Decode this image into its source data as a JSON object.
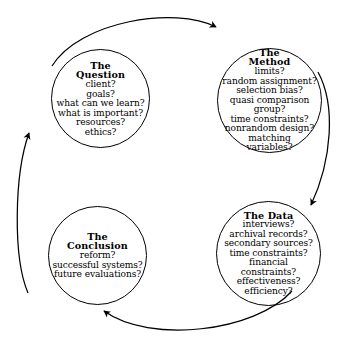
{
  "diagram": {
    "type": "cycle-diagram",
    "direction": "clockwise",
    "background_color": "#ffffff",
    "line_color": "#000000"
  },
  "nodes": [
    {
      "id": "question",
      "title_lines": [
        "The",
        "Question"
      ],
      "title_line_1": "The",
      "title_line_2": "Question",
      "items": [
        "client?",
        "goals?",
        "what can we learn?",
        "what is important?",
        "resources?",
        "ethics?"
      ]
    },
    {
      "id": "method",
      "title_lines": [
        "The",
        "Method"
      ],
      "title_line_1": "The",
      "title_line_2": "Method",
      "items": [
        "limits?",
        "random assignment?",
        "selection bias?",
        "quasi comparison",
        "group?",
        "time constraints?",
        "nonrandom design?",
        "matching",
        "variables?"
      ]
    },
    {
      "id": "data",
      "title_lines": [
        "The Data"
      ],
      "title_line_1": "The Data",
      "title_line_2": "",
      "items": [
        "interviews?",
        "archival records?",
        "secondary sources?",
        "time constraints?",
        "financial",
        "constraints?",
        "effectiveness?",
        "efficiency?"
      ]
    },
    {
      "id": "conclusion",
      "title_lines": [
        "The",
        "Conclusion"
      ],
      "title_line_1": "The",
      "title_line_2": "Conclusion",
      "items": [
        "reform?",
        "successful systems?",
        "future evaluations?"
      ]
    }
  ],
  "arrows": [
    {
      "id": "question-to-method",
      "from": "question",
      "to": "method",
      "position": "top"
    },
    {
      "id": "method-to-data",
      "from": "method",
      "to": "data",
      "position": "right"
    },
    {
      "id": "data-to-conclusion",
      "from": "data",
      "to": "conclusion",
      "position": "bottom"
    },
    {
      "id": "conclusion-to-question",
      "from": "conclusion",
      "to": "question",
      "position": "left"
    }
  ]
}
